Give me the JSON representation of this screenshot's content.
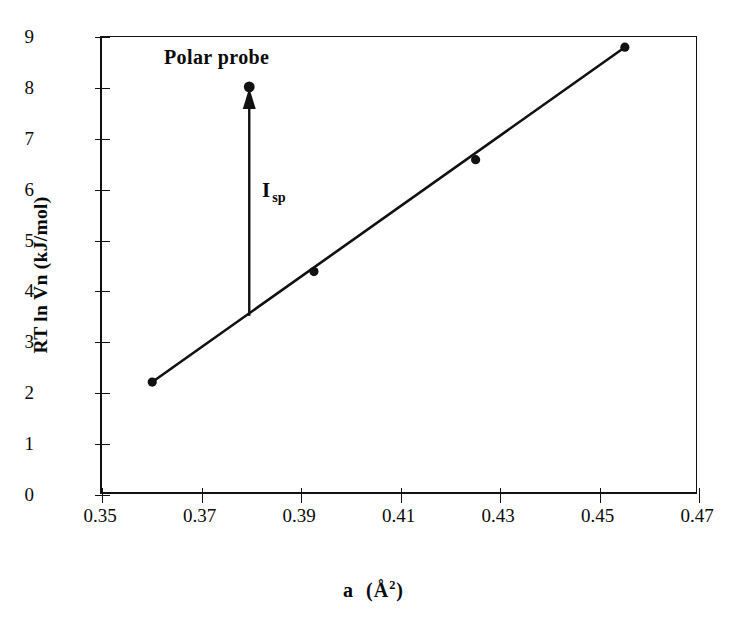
{
  "chart_data": {
    "type": "scatter",
    "title": "",
    "xlabel": "a  (Å²)",
    "ylabel": "RT ln Vn (kJ/mol)",
    "xlim": [
      0.35,
      0.47
    ],
    "ylim": [
      0,
      9
    ],
    "xticks": [
      "0.35",
      "0.37",
      "0.39",
      "0.41",
      "0.43",
      "0.45",
      "0.47"
    ],
    "xtick_values": [
      0.35,
      0.37,
      0.39,
      0.41,
      0.43,
      0.45,
      0.47
    ],
    "yticks": [
      "0",
      "1",
      "2",
      "3",
      "4",
      "5",
      "6",
      "7",
      "8",
      "9"
    ],
    "ytick_values": [
      0,
      1,
      2,
      3,
      4,
      5,
      6,
      7,
      8,
      9
    ],
    "grid": false,
    "legend": null,
    "series": [
      {
        "name": "n-alkane reference line",
        "type": "scatter-with-fit",
        "marker": "filled-circle",
        "x": [
          0.3605,
          0.393,
          0.4255,
          0.4555
        ],
        "y": [
          2.2,
          4.37,
          6.57,
          8.78
        ],
        "fit_line": {
          "x": [
            0.3605,
            0.4555
          ],
          "y": [
            2.2,
            8.78
          ]
        }
      },
      {
        "name": "Polar probe point",
        "type": "point",
        "marker": "filled-circle",
        "x": [
          0.38
        ],
        "y": [
          8.0
        ]
      }
    ],
    "annotations": [
      {
        "name": "polar-probe-label",
        "text": "Polar probe",
        "x": 0.3665,
        "y": 8.78,
        "bold": true
      },
      {
        "name": "isp-arrow",
        "type": "vertical-arrow",
        "x": 0.38,
        "y_start": 3.5,
        "y_end": 8.0,
        "direction": "up"
      },
      {
        "name": "isp-label",
        "text_main": "I",
        "text_sub": "sp",
        "text": "I sp",
        "x": 0.3865,
        "y": 6.2,
        "bold": true
      }
    ],
    "colors": {
      "axis": "#111111",
      "line": "#111111",
      "marker": "#111111",
      "background": "#ffffff"
    }
  }
}
